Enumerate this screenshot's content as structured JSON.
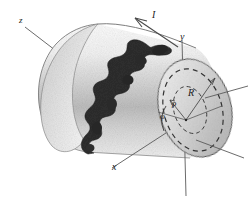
{
  "figure": {
    "background_color": "#ffffff",
    "ink_color": "#1a1a1a",
    "body_fill": "#e9e9e9",
    "crack_color": "#2b2b2b"
  },
  "labels": {
    "axis_z": "z",
    "axis_y": "y",
    "axis_x": "x",
    "current": "I",
    "radius_outer": "R",
    "radius_inner": "ρ",
    "angle": "φ"
  },
  "annotations": {
    "current_arrow_name": "current-direction-arrow",
    "crack_name": "crack-fracture-path",
    "cylinder_name": "cylinder-body",
    "cross_section_name": "circular-cross-section"
  }
}
